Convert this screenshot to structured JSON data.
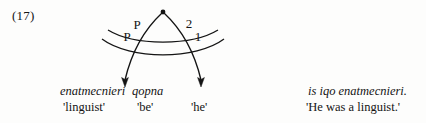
{
  "example": {
    "number_label": "(17)"
  },
  "diagram": {
    "type": "relational-grammar-stratal-arc-diagram",
    "apex_node_name": "apex-node",
    "arc_labels": [
      {
        "id": "p-upper",
        "text": "P",
        "position": "upper-left"
      },
      {
        "id": "p-lower",
        "text": "P",
        "position": "lower-left"
      },
      {
        "id": "two",
        "text": "2",
        "position": "upper-right"
      },
      {
        "id": "one",
        "text": "1",
        "position": "lower-right"
      }
    ],
    "arrow_count": 2,
    "stroke_color": "#141414"
  },
  "left_column": {
    "transcription_words": [
      "enatmecnieri",
      "qopna"
    ],
    "gloss_words": [
      "'linguist'",
      "'be'",
      "'he'"
    ]
  },
  "right_column": {
    "transcription": "is iqo enatmecnieri.",
    "translation": "'He was a linguist.'"
  }
}
